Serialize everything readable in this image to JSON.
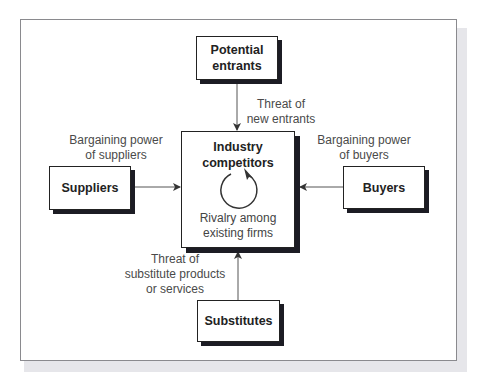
{
  "diagram": {
    "nodes": {
      "potential_entrants": {
        "line1": "Potential",
        "line2": "entrants"
      },
      "suppliers": {
        "label": "Suppliers"
      },
      "buyers": {
        "label": "Buyers"
      },
      "substitutes": {
        "label": "Substitutes"
      },
      "industry": {
        "title1": "Industry",
        "title2": "competitors",
        "sub1": "Rivalry among",
        "sub2": "existing firms",
        "icon": "cycle-arrow-icon"
      }
    },
    "edges": {
      "entrants": {
        "line1": "Threat of",
        "line2": "new entrants",
        "from": "potential_entrants",
        "to": "industry"
      },
      "suppliers": {
        "line1": "Bargaining power",
        "line2": "of suppliers",
        "from": "suppliers",
        "to": "industry"
      },
      "buyers": {
        "line1": "Bargaining power",
        "line2": "of buyers",
        "from": "buyers",
        "to": "industry"
      },
      "substitutes": {
        "line1": "Threat of",
        "line2": "substitute products",
        "line3": "or services",
        "from": "substitutes",
        "to": "industry"
      }
    },
    "colors": {
      "box_border": "#222222",
      "box_shadow": "#1c1c24",
      "text": "#222222",
      "label_text": "#4a4a4a",
      "frame_border": "#8a8a8e"
    }
  }
}
